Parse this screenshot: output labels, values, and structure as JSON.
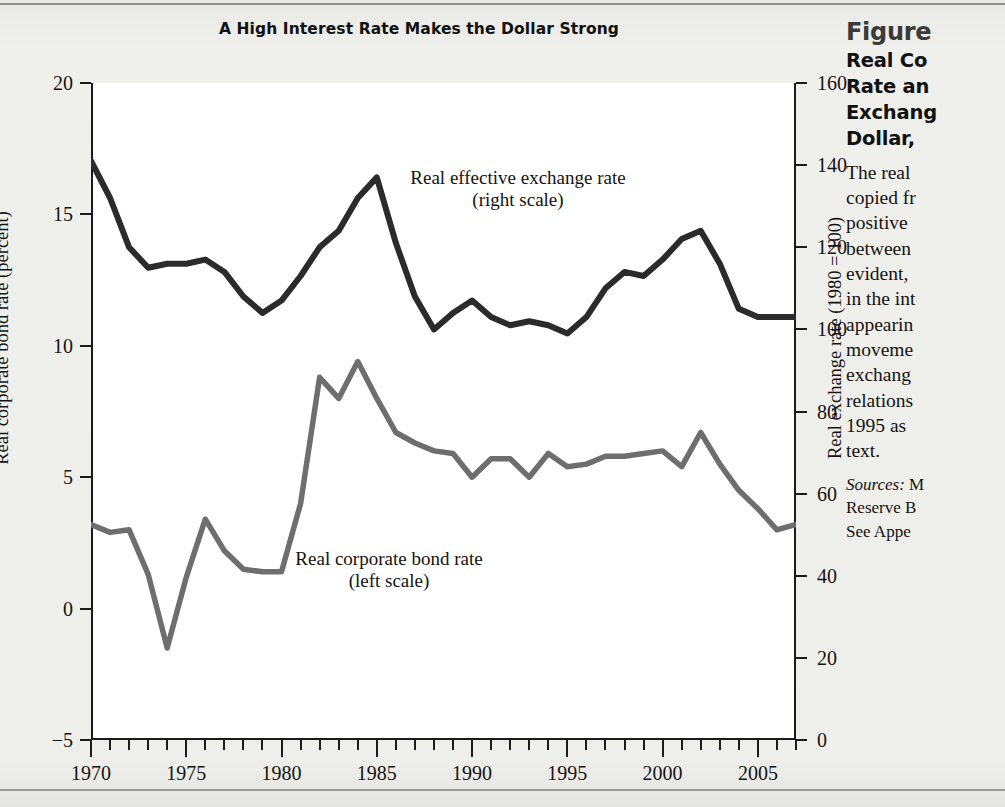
{
  "figure": {
    "chart_title": "A High Interest Rate Makes the Dollar Strong",
    "left_axis_title": "Real corporate bond rate (percent)",
    "right_axis_title": "Real exchange rate (1980 = 100)",
    "series_label_exchange_line1": "Real effective exchange rate",
    "series_label_exchange_line2": "(right scale)",
    "series_label_bond_line1": "Real corporate bond rate",
    "series_label_bond_line2": "(left scale)"
  },
  "caption": {
    "figure_number": "Figure",
    "title_lines": [
      "Real Co",
      "Rate an",
      "Exchang",
      "Dollar, "
    ],
    "body_lines": [
      "The real",
      "copied fr",
      "positive",
      "between",
      "evident,",
      "in the int",
      "appearin",
      "moveme",
      "exchang",
      "relations",
      "1995 as ",
      "text."
    ],
    "sources_label": "Sources:",
    "sources_lines": [
      "M",
      "Reserve B",
      "See Appe"
    ]
  },
  "colors": {
    "exchange_line": "#2b2b2b",
    "bond_line": "#6e6e6e",
    "axis": "#1b1b1b",
    "page_background": "#eeeeec",
    "plot_background": "#ffffff"
  },
  "chart_data": {
    "type": "line",
    "title": "A High Interest Rate Makes the Dollar Strong",
    "xlabel": "",
    "ylabel": "Real corporate bond rate (percent)",
    "y2label": "Real exchange rate (1980 = 100)",
    "xlim": [
      1970,
      2007
    ],
    "ylim": [
      -5,
      20
    ],
    "y2lim": [
      0,
      160
    ],
    "grid": false,
    "legend": "inline-annotations",
    "xticks_major": [
      1970,
      1975,
      1980,
      1985,
      1990,
      1995,
      2000,
      2005
    ],
    "xticks_minor_step": 1,
    "yticks_left": [
      -5,
      0,
      5,
      10,
      15,
      20
    ],
    "yticks_right": [
      0,
      20,
      40,
      60,
      80,
      100,
      120,
      140,
      160
    ],
    "x": [
      1970,
      1971,
      1972,
      1973,
      1974,
      1975,
      1976,
      1977,
      1978,
      1979,
      1980,
      1981,
      1982,
      1983,
      1984,
      1985,
      1986,
      1987,
      1988,
      1989,
      1990,
      1991,
      1992,
      1993,
      1994,
      1995,
      1996,
      1997,
      1998,
      1999,
      2000,
      2001,
      2002,
      2003,
      2004,
      2005,
      2006,
      2007
    ],
    "series": [
      {
        "name": "Real effective exchange rate (right scale)",
        "axis": "right",
        "color": "#2b2b2b",
        "units": "index, 1980 = 100",
        "values": [
          141,
          132,
          120,
          115,
          116,
          116,
          117,
          114,
          108,
          104,
          107,
          113,
          120,
          124,
          132,
          137,
          121,
          108,
          100,
          104,
          107,
          103,
          101,
          102,
          101,
          99,
          103,
          110,
          114,
          113,
          117,
          122,
          124,
          116,
          105,
          103,
          103,
          103
        ]
      },
      {
        "name": "Real corporate bond rate (left scale)",
        "axis": "left",
        "color": "#6e6e6e",
        "units": "percent",
        "values": [
          3.2,
          2.9,
          3.0,
          1.3,
          -1.5,
          1.2,
          3.4,
          2.2,
          1.5,
          1.4,
          1.4,
          4.0,
          8.8,
          8.0,
          9.4,
          8.0,
          6.7,
          6.3,
          6.0,
          5.9,
          5.0,
          5.7,
          5.7,
          5.0,
          5.9,
          5.4,
          5.5,
          5.8,
          5.8,
          5.9,
          6.0,
          5.4,
          6.7,
          5.5,
          4.5,
          3.8,
          3.0,
          3.2
        ]
      }
    ]
  }
}
